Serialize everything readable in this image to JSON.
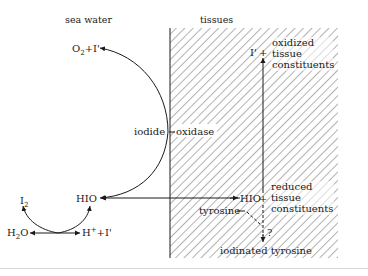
{
  "diagram": {
    "regions": {
      "left_label": "sea water",
      "right_label": "tissues"
    },
    "nodes": {
      "o2_iodide": {
        "base": "O",
        "sub": "2",
        "rest": "+I'"
      },
      "iodide": "iodide",
      "oxidase": "oxidase",
      "hio_left": "HIO",
      "i2": {
        "base": "I",
        "sub": "2"
      },
      "h2o": {
        "base": "H",
        "sub": "2",
        "rest": "O"
      },
      "h_plus_i": {
        "base": "H",
        "sup": "+",
        "rest": "+I'"
      },
      "i_prime_top": "I'",
      "plus_top": "+",
      "oxidized": [
        "oxidized",
        "tissue",
        "constituents"
      ],
      "hio_right": "HIO",
      "plus_mid": "+",
      "reduced": [
        "reduced",
        "tissue",
        "constituents"
      ],
      "tyrosine": "tyrosine",
      "question": "?",
      "iodinated_tyrosine": "iodinated tyrosine"
    },
    "colors": {
      "ink": "#1a1a1a",
      "hatch": "#555555",
      "background": "#ffffff"
    }
  }
}
